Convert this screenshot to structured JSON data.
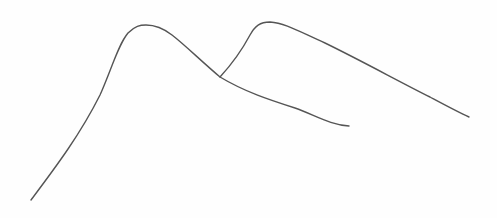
{
  "sketch": {
    "description": "Hand-drawn pencil sketch of two overlapping mountain-like curves",
    "stroke_color": "#555555",
    "background_color": "#fefefe",
    "curves": [
      {
        "name": "left-mountain",
        "path": "M 31 200 C 55 168, 80 135, 100 95 C 112 68, 118 45, 128 33 C 135 26, 140 25, 146 25 C 156 25, 163 28, 172 35 C 185 45, 200 60, 220 77 C 245 92, 270 100, 295 108 C 315 115, 330 125, 349 126"
      },
      {
        "name": "right-mountain",
        "path": "M 220 77 C 232 64, 242 50, 250 35 C 255 26, 260 22, 270 22 C 285 23, 300 32, 325 43 C 360 60, 400 82, 430 97 C 445 105, 458 112, 469 117"
      }
    ]
  }
}
